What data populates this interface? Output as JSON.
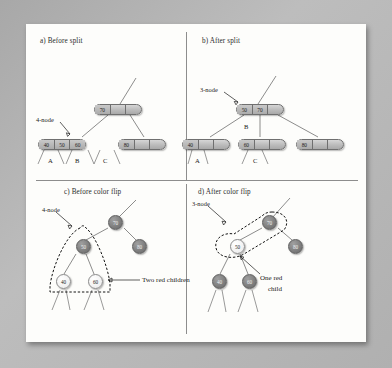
{
  "figure": {
    "background_color": "#b0b0b0",
    "page_color": "#fdfdfb"
  },
  "panels": [
    {
      "id": "a",
      "caption": "a) Before split",
      "type": "2-3-tree",
      "annotation": "4-node",
      "nodes": [
        {
          "name": "root",
          "values": [
            "70",
            "",
            ""
          ]
        },
        {
          "name": "left-child",
          "values": [
            "40",
            "50",
            "60"
          ]
        },
        {
          "name": "right-child",
          "values": [
            "80",
            "",
            ""
          ]
        }
      ],
      "subtree_labels": [
        "A",
        "B",
        "C"
      ]
    },
    {
      "id": "b",
      "caption": "b) After split",
      "type": "2-3-tree",
      "annotation": "3-node",
      "nodes": [
        {
          "name": "root",
          "values": [
            "50",
            "70",
            ""
          ]
        },
        {
          "name": "left-child",
          "values": [
            "40",
            "",
            ""
          ]
        },
        {
          "name": "middle-child",
          "values": [
            "60",
            "",
            ""
          ]
        },
        {
          "name": "right-child",
          "values": [
            "80",
            "",
            ""
          ]
        }
      ],
      "subtree_labels": [
        "A",
        "B",
        "C"
      ]
    },
    {
      "id": "c",
      "caption": "c) Before color flip",
      "type": "red-black-tree",
      "annotation": "4-node",
      "callout": "Two red children",
      "nodes": [
        {
          "name": "root",
          "value": "70",
          "color": "dark"
        },
        {
          "name": "root-right",
          "value": "80",
          "color": "dark"
        },
        {
          "name": "inner",
          "value": "50",
          "color": "dark"
        },
        {
          "name": "leaf-left",
          "value": "40",
          "color": "light"
        },
        {
          "name": "leaf-right",
          "value": "60",
          "color": "light"
        }
      ]
    },
    {
      "id": "d",
      "caption": "d) After color flip",
      "type": "red-black-tree",
      "annotation": "3-node",
      "callout_line1": "One red",
      "callout_line2": "child",
      "nodes": [
        {
          "name": "root",
          "value": "70",
          "color": "dark"
        },
        {
          "name": "root-right",
          "value": "80",
          "color": "dark"
        },
        {
          "name": "inner",
          "value": "50",
          "color": "light"
        },
        {
          "name": "leaf-left",
          "value": "40",
          "color": "dark"
        },
        {
          "name": "leaf-right",
          "value": "60",
          "color": "dark"
        }
      ]
    }
  ]
}
